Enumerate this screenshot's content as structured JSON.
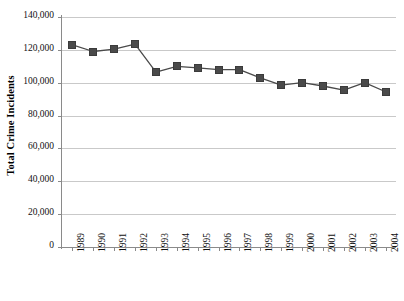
{
  "chart_data": {
    "type": "line",
    "title": "",
    "xlabel": "",
    "ylabel": "Total Crime Incidents",
    "ylim": [
      0,
      140000
    ],
    "ytick_labels": [
      "0",
      "20,000",
      "40,000",
      "60,000",
      "80,000",
      "100,000",
      "120,000",
      "140,000"
    ],
    "ytick_values": [
      0,
      20000,
      40000,
      60000,
      80000,
      100000,
      120000,
      140000
    ],
    "grid": true,
    "legend": "none",
    "marker_style": "square",
    "marker_color": "#4a4a4a",
    "line_color": "#4a4a4a",
    "categories": [
      "1989",
      "1990",
      "1991",
      "1992",
      "1993",
      "1994",
      "1995",
      "1996",
      "1997",
      "1998",
      "1999",
      "2000",
      "2001",
      "2002",
      "2003",
      "2004"
    ],
    "values": [
      123000,
      119000,
      120500,
      123500,
      106500,
      110000,
      109000,
      108000,
      108000,
      103000,
      98500,
      100000,
      98000,
      95500,
      100000,
      94500
    ],
    "series": [
      {
        "name": "Total Crime Incidents",
        "values": [
          123000,
          119000,
          120500,
          123500,
          106500,
          110000,
          109000,
          108000,
          108000,
          103000,
          98500,
          100000,
          98000,
          95500,
          100000,
          94500
        ]
      }
    ]
  },
  "axes": {
    "y_title": "Total Crime Incidents"
  }
}
